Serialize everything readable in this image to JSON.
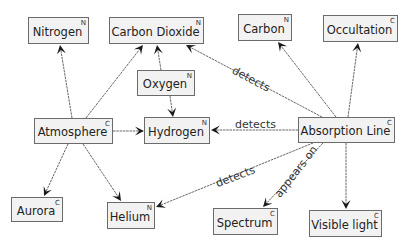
{
  "nodes": [
    {
      "id": "nitrogen",
      "label": "Nitrogen",
      "type": "N",
      "x": 28,
      "y": 17,
      "w": 61,
      "h": 27
    },
    {
      "id": "carbon_dioxide",
      "label": "Carbon Dioxide",
      "type": "N",
      "x": 109,
      "y": 17,
      "w": 95,
      "h": 27
    },
    {
      "id": "carbon",
      "label": "Carbon",
      "type": "N",
      "x": 238,
      "y": 14,
      "w": 54,
      "h": 27
    },
    {
      "id": "occultation",
      "label": "Occultation",
      "type": "C",
      "x": 323,
      "y": 15,
      "w": 75,
      "h": 27
    },
    {
      "id": "oxygen",
      "label": "Oxygen",
      "type": "N",
      "x": 137,
      "y": 70,
      "w": 58,
      "h": 26
    },
    {
      "id": "atmosphere",
      "label": "Atmosphere",
      "type": "C",
      "x": 34,
      "y": 118,
      "w": 79,
      "h": 26
    },
    {
      "id": "hydrogen",
      "label": "Hydrogen",
      "type": "N",
      "x": 144,
      "y": 117,
      "w": 66,
      "h": 27
    },
    {
      "id": "absorption_line",
      "label": "Absorption Line",
      "type": "C",
      "x": 298,
      "y": 117,
      "w": 97,
      "h": 26
    },
    {
      "id": "aurora",
      "label": "Aurora",
      "type": "C",
      "x": 11,
      "y": 197,
      "w": 52,
      "h": 25
    },
    {
      "id": "helium",
      "label": "Helium",
      "type": "N",
      "x": 107,
      "y": 202,
      "w": 48,
      "h": 27
    },
    {
      "id": "spectrum",
      "label": "Spectrum",
      "type": "C",
      "x": 213,
      "y": 208,
      "w": 65,
      "h": 27
    },
    {
      "id": "visible_light",
      "label": "Visible light",
      "type": "C",
      "x": 309,
      "y": 210,
      "w": 73,
      "h": 27
    }
  ],
  "edges": [
    {
      "from": "atmosphere",
      "to": "nitrogen",
      "label": "",
      "x1": 72,
      "y1": 118,
      "x2": 60,
      "y2": 45
    },
    {
      "from": "atmosphere",
      "to": "carbon_dioxide",
      "label": "",
      "x1": 86,
      "y1": 118,
      "x2": 143,
      "y2": 45
    },
    {
      "from": "oxygen",
      "to": "carbon_dioxide",
      "label": "",
      "x1": 161,
      "y1": 70,
      "x2": 157,
      "y2": 45
    },
    {
      "from": "oxygen",
      "to": "hydrogen",
      "label": "",
      "x1": 170,
      "y1": 96,
      "x2": 173,
      "y2": 117
    },
    {
      "from": "atmosphere",
      "to": "hydrogen",
      "label": "",
      "x1": 113,
      "y1": 131,
      "x2": 144,
      "y2": 131
    },
    {
      "from": "atmosphere",
      "to": "aurora",
      "label": "",
      "x1": 68,
      "y1": 144,
      "x2": 44,
      "y2": 196
    },
    {
      "from": "atmosphere",
      "to": "helium",
      "label": "",
      "x1": 83,
      "y1": 144,
      "x2": 121,
      "y2": 201
    },
    {
      "from": "absorption_line",
      "to": "carbon_dioxide",
      "label": "detects",
      "x1": 322,
      "y1": 117,
      "x2": 186,
      "y2": 45
    },
    {
      "from": "absorption_line",
      "to": "carbon",
      "label": "",
      "x1": 336,
      "y1": 117,
      "x2": 278,
      "y2": 42
    },
    {
      "from": "absorption_line",
      "to": "occultation",
      "label": "",
      "x1": 348,
      "y1": 117,
      "x2": 358,
      "y2": 43
    },
    {
      "from": "absorption_line",
      "to": "hydrogen",
      "label": "detects",
      "x1": 298,
      "y1": 130,
      "x2": 211,
      "y2": 130
    },
    {
      "from": "absorption_line",
      "to": "helium",
      "label": "detects",
      "x1": 313,
      "y1": 143,
      "x2": 156,
      "y2": 207
    },
    {
      "from": "absorption_line",
      "to": "spectrum",
      "label": "appears on",
      "x1": 323,
      "y1": 143,
      "x2": 263,
      "y2": 207
    },
    {
      "from": "absorption_line",
      "to": "visible_light",
      "label": "",
      "x1": 346,
      "y1": 143,
      "x2": 346,
      "y2": 209
    }
  ],
  "edge_labels": [
    {
      "text": "detects",
      "x": 236,
      "y": 64,
      "angle": 28
    },
    {
      "text": "detects",
      "x": 235,
      "y": 118,
      "angle": 0
    },
    {
      "text": "detects",
      "x": 214,
      "y": 178,
      "angle": -21
    },
    {
      "text": "appears on",
      "x": 272,
      "y": 192,
      "angle": -52
    }
  ]
}
